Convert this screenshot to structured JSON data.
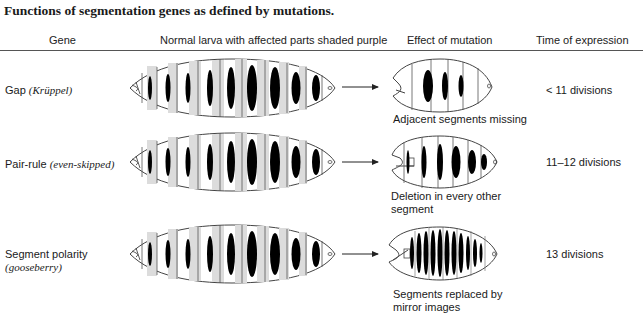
{
  "title": "Functions of segmentation genes as defined by mutations.",
  "headers": {
    "gene": "Gene",
    "normal": "Normal larva with affected parts shaded purple",
    "effect": "Effect of mutation",
    "time": "Time of expression"
  },
  "rows": [
    {
      "gene": "Gap",
      "gene_italic": "(Krüppel)",
      "gene_line2": "",
      "effect_line1": "Adjacent segments missing",
      "effect_line2": "",
      "time": "< 11 divisions"
    },
    {
      "gene": "Pair-rule",
      "gene_italic": "(even-skipped)",
      "gene_line2": "",
      "effect_line1": "Deletion in every other",
      "effect_line2": "segment",
      "time": "11–12 divisions"
    },
    {
      "gene": "Segment polarity",
      "gene_italic": "",
      "gene_line2": "(gooseberry)",
      "effect_line1": "Segments replaced by",
      "effect_line2": "mirror images",
      "time": "13 divisions"
    }
  ],
  "colors": {
    "band": "#000000",
    "shade": "#d9d9d9",
    "outline": "#444444"
  }
}
